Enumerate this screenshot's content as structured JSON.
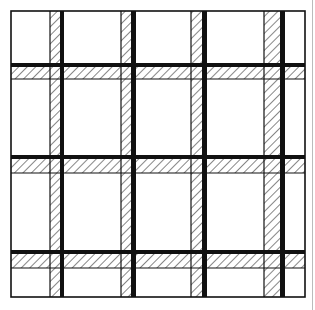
{
  "diagram": {
    "colors": {
      "line": "#111111",
      "background": "#ffffff",
      "hatch": "#222222"
    },
    "frame": {
      "x": 11,
      "y": 11,
      "w": 294,
      "h": 286
    },
    "vertical_bands": [
      {
        "hatch_x": 50,
        "hatch_w": 10,
        "thick_x": 60,
        "thick_w": 4
      },
      {
        "hatch_x": 121,
        "hatch_w": 10,
        "thick_x": 131,
        "thick_w": 5
      },
      {
        "hatch_x": 191,
        "hatch_w": 11,
        "thick_x": 202,
        "thick_w": 5
      },
      {
        "hatch_x": 264,
        "hatch_w": 16,
        "thick_x": 280,
        "thick_w": 5
      }
    ],
    "horizontal_bands": [
      {
        "thick_y": 63,
        "thick_h": 4,
        "hatch_y": 67,
        "hatch_h": 12
      },
      {
        "thick_y": 155,
        "thick_h": 4,
        "hatch_y": 159,
        "hatch_h": 14
      },
      {
        "thick_y": 250,
        "thick_h": 4,
        "hatch_y": 254,
        "hatch_h": 14
      }
    ]
  }
}
